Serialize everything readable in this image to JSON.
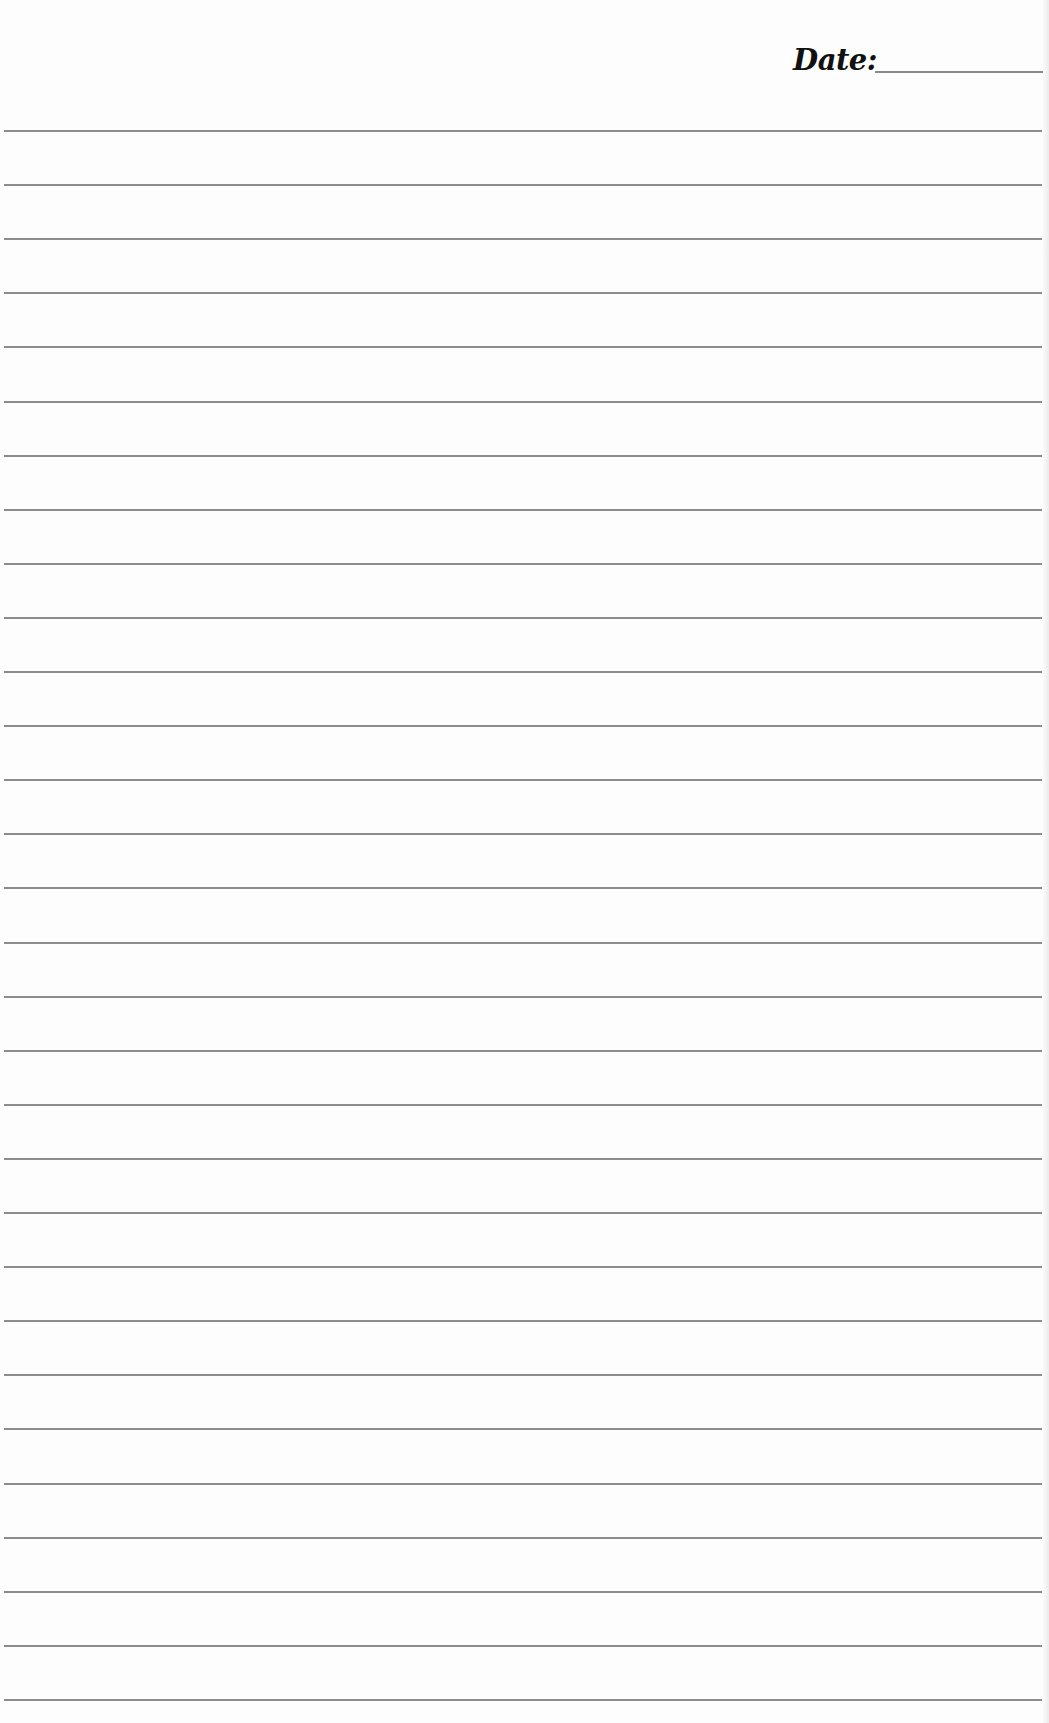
{
  "header": {
    "date_label": "Date:",
    "date_value": ""
  },
  "ruled_lines": {
    "count": 30,
    "first_y": 130,
    "spacing": 54.1,
    "color": "#8c8c8c"
  },
  "colors": {
    "paper": "#fdfdfd",
    "ink": "#111111"
  }
}
